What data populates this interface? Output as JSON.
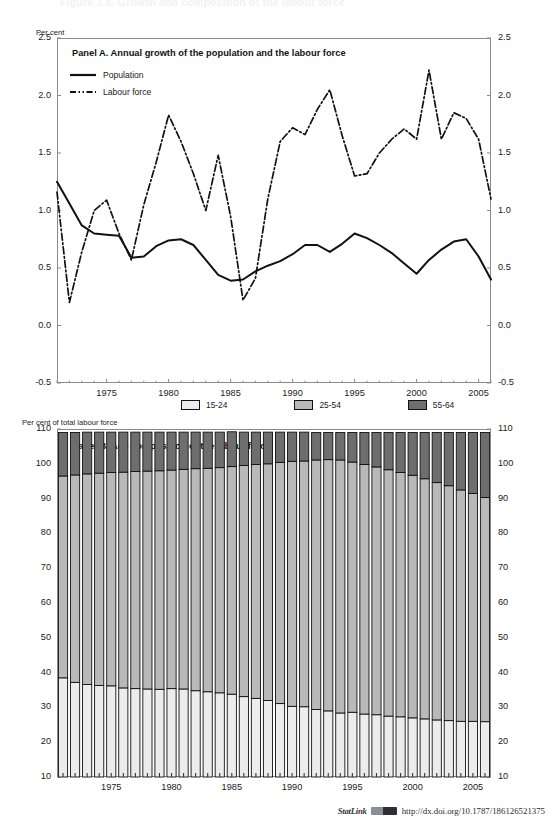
{
  "figure": {
    "cut_off_heading": "Figure 1.8. Growth and composition of the labour force",
    "statlink_label": "StatLink",
    "statlink_url": "http://dx.doi.org/10.1787/186126521375"
  },
  "panelA": {
    "title": "Panel A. Annual growth of the population and the labour force",
    "unit_label": "Per cent",
    "yticks": [
      "2.5",
      "2.0",
      "1.5",
      "1.0",
      "0.5",
      "0.0",
      "-0.5"
    ],
    "xticks": [
      "1975",
      "1980",
      "1985",
      "1990",
      "1995",
      "2000",
      "2005"
    ],
    "legend": [
      {
        "label": "Population",
        "style": "solid",
        "name": "population"
      },
      {
        "label": "Labour force",
        "style": "dash-dot",
        "name": "labour-force"
      }
    ]
  },
  "panelB": {
    "title": "Panel B. Age composition of the labour force",
    "unit_label": "Per cent of total labour force",
    "yticks": [
      "110",
      "100",
      "90",
      "80",
      "70",
      "60",
      "50",
      "40",
      "30",
      "20",
      "10"
    ],
    "xticks": [
      "1975",
      "1980",
      "1985",
      "1990",
      "1995",
      "2000",
      "2005"
    ],
    "legend": [
      {
        "label": "15-24",
        "color": "#ececec"
      },
      {
        "label": "25-54",
        "color": "#b9b9b9"
      },
      {
        "label": "55-64",
        "color": "#6e6e6e"
      }
    ]
  },
  "colors": {
    "age_15_24": "#ececec",
    "age_25_54": "#b9b9b9",
    "age_55_64": "#6e6e6e",
    "line": "#111111",
    "frame": "#8a8a8a"
  },
  "chart_data": [
    {
      "type": "line",
      "panel": "A",
      "title": "Panel A. Annual growth of the population and the labour force",
      "xlabel": "",
      "ylabel": "Per cent",
      "ylim": [
        -0.5,
        2.5
      ],
      "xlim": [
        1971,
        2006
      ],
      "ytick_step": 0.5,
      "grid": false,
      "legend_position": "inside-top-left",
      "x": [
        1971,
        1972,
        1973,
        1974,
        1975,
        1976,
        1977,
        1978,
        1979,
        1980,
        1981,
        1982,
        1983,
        1984,
        1985,
        1986,
        1987,
        1988,
        1989,
        1990,
        1991,
        1992,
        1993,
        1994,
        1995,
        1996,
        1997,
        1998,
        1999,
        2000,
        2001,
        2002,
        2003,
        2004,
        2005,
        2006
      ],
      "series": [
        {
          "name": "Population",
          "style": "solid",
          "values": [
            1.25,
            1.06,
            0.87,
            0.8,
            0.79,
            0.78,
            0.59,
            0.6,
            0.69,
            0.74,
            0.75,
            0.7,
            0.57,
            0.44,
            0.39,
            0.4,
            0.47,
            0.52,
            0.56,
            0.62,
            0.7,
            0.7,
            0.64,
            0.71,
            0.8,
            0.76,
            0.7,
            0.63,
            0.54,
            0.45,
            0.57,
            0.66,
            0.73,
            0.75,
            0.6,
            0.4,
            0.2
          ]
        },
        {
          "name": "Labour force",
          "style": "dash-dot",
          "values": [
            1.16,
            0.2,
            0.64,
            1.0,
            1.09,
            0.8,
            0.57,
            1.05,
            1.42,
            1.83,
            1.6,
            1.32,
            1.0,
            1.48,
            0.95,
            0.22,
            0.41,
            1.1,
            1.6,
            1.72,
            1.66,
            1.88,
            2.05,
            1.65,
            1.3,
            1.32,
            1.5,
            1.62,
            1.71,
            1.62,
            2.22,
            1.62,
            1.85,
            1.8,
            1.62,
            1.1,
            0.6,
            0.25,
            -0.07,
            0.25,
            0.52
          ]
        }
      ]
    },
    {
      "type": "bar",
      "subtype": "stacked",
      "panel": "B",
      "title": "Panel B. Age composition of the labour force",
      "xlabel": "",
      "ylabel": "Per cent of total labour force",
      "ylim": [
        10,
        110
      ],
      "ytick_step": 10,
      "grid": false,
      "legend_position": "above-plot",
      "categories": [
        1971,
        1972,
        1973,
        1974,
        1975,
        1976,
        1977,
        1978,
        1979,
        1980,
        1981,
        1982,
        1983,
        1984,
        1985,
        1986,
        1987,
        1988,
        1989,
        1990,
        1991,
        1992,
        1993,
        1994,
        1995,
        1996,
        1997,
        1998,
        1999,
        2000,
        2001,
        2002,
        2003,
        2004,
        2005,
        2006
      ],
      "series": [
        {
          "name": "15-24",
          "color": "#ececec",
          "values": [
            28.5,
            27.2,
            26.6,
            26.3,
            26.2,
            25.6,
            25.4,
            25.3,
            25.2,
            25.4,
            25.3,
            24.8,
            24.5,
            24.2,
            23.8,
            23.1,
            22.6,
            22.0,
            21.1,
            20.3,
            20.2,
            19.4,
            19.0,
            18.4,
            18.6,
            18.1,
            17.9,
            17.5,
            17.3,
            17.0,
            16.7,
            16.4,
            16.2,
            16.0,
            16.0,
            15.9
          ]
        },
        {
          "name": "25-54",
          "color": "#b9b9b9",
          "values": [
            58.0,
            59.6,
            60.5,
            61.0,
            61.3,
            62.0,
            62.4,
            62.6,
            62.8,
            62.8,
            63.1,
            63.8,
            64.2,
            64.7,
            65.4,
            66.4,
            67.2,
            68.0,
            69.3,
            70.4,
            70.6,
            71.7,
            72.2,
            72.7,
            71.9,
            71.7,
            71.2,
            70.8,
            70.2,
            69.7,
            69.0,
            68.2,
            67.5,
            66.5,
            65.5,
            64.4
          ]
        },
        {
          "name": "55-64",
          "color": "#6e6e6e",
          "values": [
            12.5,
            12.2,
            12.0,
            11.8,
            11.6,
            11.5,
            11.3,
            11.2,
            11.1,
            10.9,
            10.7,
            10.5,
            10.4,
            10.2,
            10.0,
            9.6,
            9.3,
            9.1,
            8.7,
            8.4,
            8.3,
            7.9,
            7.8,
            7.9,
            8.5,
            9.2,
            9.9,
            10.7,
            11.5,
            12.3,
            13.3,
            14.4,
            15.3,
            16.5,
            17.5,
            18.7
          ]
        }
      ]
    }
  ]
}
